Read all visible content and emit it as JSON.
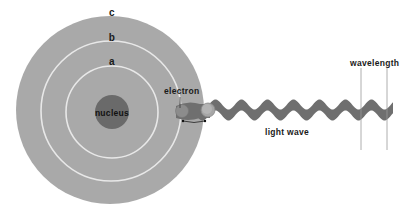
{
  "diagram": {
    "title": "",
    "labels": {
      "orbit_c": "c",
      "orbit_b": "b",
      "orbit_a": "a",
      "nucleus": "nucleus",
      "electron": "electron",
      "light_wave": "light wave",
      "wavelength": "wavelength"
    },
    "colors": {
      "background": "#ffffff",
      "atom_disk": "#a9a9a9",
      "orbit_lines": "#e8e8e8",
      "nucleus": "#6a6a6a",
      "electron": "#8c8c8c",
      "wave": "#6f6f6f",
      "text": "#1a1a1a",
      "wavelength_lines": "#9a9a9a"
    },
    "geometry": {
      "atom_center": [
        110,
        110
      ],
      "atom_radius": 94,
      "orbit_b_radius": 70,
      "orbit_a_radius": 46,
      "nucleus_radius": 17,
      "electron_position": [
        182,
        111
      ],
      "emitted_electron_position": [
        208,
        110
      ],
      "wave_start_x": 196,
      "wave_end_x": 393,
      "wave_center_y": 110,
      "wave_amplitude": 5,
      "wave_period": 26,
      "wave_thickness": 11,
      "wavelength_marker_x": [
        361,
        387
      ]
    }
  }
}
